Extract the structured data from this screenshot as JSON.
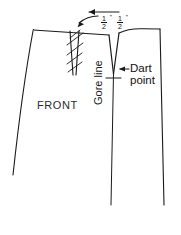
{
  "diagram": {
    "type": "sewing-pattern-technical-drawing",
    "ink_color": "#1a1a1a",
    "background_color": "#ffffff",
    "labels": {
      "front": "FRONT",
      "dart_point_line1": "Dart",
      "dart_point_line2": "point",
      "gore_line": "Gore line"
    },
    "measurements": [
      {
        "numerator": "1",
        "denominator": "2",
        "unit": "″",
        "text": "1/2″"
      },
      {
        "numerator": "1",
        "denominator": "2",
        "unit": "″",
        "text": "1/2″"
      }
    ],
    "annotations": {
      "straight_arrow_direction": "left",
      "curved_arrow_direction": "right",
      "dart_point_arrow_direction": "left"
    },
    "features": [
      "hatched-dart-strip",
      "v-dart-opening",
      "gore-line",
      "dart-point-tick",
      "waistline",
      "side-seam",
      "center-front-edge"
    ]
  }
}
